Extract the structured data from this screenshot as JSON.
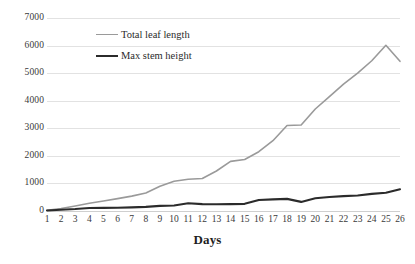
{
  "chart_data": {
    "type": "line",
    "title": "",
    "xlabel": "Days",
    "ylabel": "",
    "x": [
      1,
      2,
      3,
      4,
      5,
      6,
      7,
      8,
      9,
      10,
      11,
      12,
      13,
      14,
      15,
      16,
      17,
      18,
      19,
      20,
      21,
      22,
      23,
      24,
      25,
      26
    ],
    "xtick_labels": [
      "1",
      "2",
      "3",
      "4",
      "5",
      "6",
      "7",
      "8",
      "9",
      "10",
      "11",
      "12",
      "13",
      "14",
      "15",
      "16",
      "17",
      "18",
      "19",
      "20",
      "21",
      "22",
      "23",
      "24",
      "25",
      "26"
    ],
    "ytick_labels": [
      "0",
      "1000",
      "2000",
      "3000",
      "4000",
      "5000",
      "6000",
      "7000"
    ],
    "yticks": [
      0,
      1000,
      2000,
      3000,
      4000,
      5000,
      6000,
      7000
    ],
    "ylim": [
      0,
      7000
    ],
    "xlim": [
      1,
      26
    ],
    "grid": true,
    "legend_position": "top-left-inside",
    "series": [
      {
        "name": "Total leaf length",
        "color": "#9a9a9a",
        "width": 1.6,
        "values": [
          30,
          90,
          180,
          280,
          360,
          450,
          540,
          650,
          900,
          1080,
          1150,
          1180,
          1450,
          1800,
          1870,
          2150,
          2550,
          3100,
          3120,
          3700,
          4150,
          4600,
          5000,
          5450,
          6010,
          5430
        ]
      },
      {
        "name": "Max stem height",
        "color": "#2b2b2b",
        "width": 2.1,
        "values": [
          20,
          45,
          70,
          110,
          115,
          120,
          130,
          150,
          185,
          200,
          280,
          250,
          245,
          250,
          260,
          400,
          420,
          440,
          330,
          460,
          510,
          540,
          560,
          620,
          660,
          790
        ]
      }
    ]
  },
  "axis": {
    "x_title": "Days"
  },
  "legend": {
    "items": [
      {
        "label": "Total leaf length",
        "color": "#9a9a9a",
        "width": "1.6px"
      },
      {
        "label": "Max stem height",
        "color": "#2b2b2b",
        "width": "2.4px"
      }
    ]
  }
}
